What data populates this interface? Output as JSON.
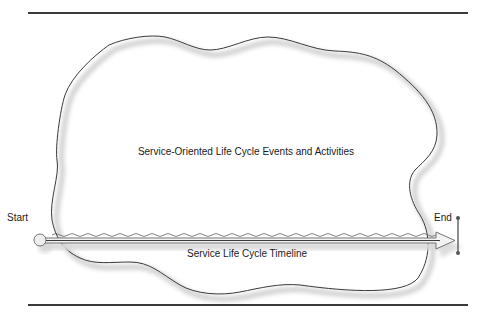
{
  "figure": {
    "cloud_label": "Service-Oriented Life Cycle Events and Activities",
    "timeline_label": "Service Life Cycle Timeline",
    "start_label": "Start",
    "end_label": "End"
  },
  "colors": {
    "outline": "#3a3a3a",
    "shadow": "#d6d6d6",
    "timeline_fill": "#eeeeee",
    "text": "#1a1a1a",
    "background": "#ffffff"
  }
}
